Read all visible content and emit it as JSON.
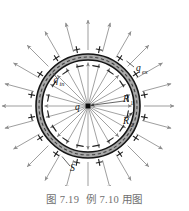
{
  "figure": {
    "caption_label": "图 7.19",
    "caption_text": "例 7.10 用图",
    "center_charge_label": "q",
    "inner_surface_charge_label": "q",
    "inner_surface_charge_sub": "in",
    "outer_surface_charge_label": "q",
    "outer_surface_charge_sub": "ex",
    "inner_radius_label": "R",
    "inner_radius_sub": "1",
    "outer_radius_label": "R",
    "outer_radius_sub": "2",
    "gaussian_surface_label": "S",
    "plus_sign": "+",
    "minus_sign": "−"
  },
  "chart_data": {
    "type": "diagram",
    "title": "图 7.19  例 7.10 用图",
    "center": {
      "x": 88,
      "y": 106
    },
    "geometry": {
      "cavity_radius_px": 46,
      "shell_inner_radius_px": 46,
      "shell_outer_radius_px": 52,
      "gaussian_dashed_radius_px": 49,
      "outer_field_line_end_radius_px": 86
    },
    "elements": [
      {
        "name": "point-charge",
        "label": "q",
        "position": "center",
        "kind": "filled-square-dot"
      },
      {
        "name": "shell-annulus",
        "fill": "#a8a8a8",
        "stroke": "#1a1a1a",
        "kind": "conducting-shell"
      },
      {
        "name": "gaussian-surface",
        "label": "S",
        "kind": "dashed-circle",
        "stroke": "#4d4d4d"
      },
      {
        "name": "inner-induced-charge",
        "label": "q",
        "sub": "in",
        "sign": "−"
      },
      {
        "name": "outer-induced-charge",
        "label": "q",
        "sub": "ex",
        "sign": "+"
      },
      {
        "name": "inner-radius-arrow",
        "label": "R",
        "sub": "1"
      },
      {
        "name": "outer-radius-arrow",
        "label": "R",
        "sub": "2"
      }
    ],
    "field_lines": {
      "inner_count": 24,
      "outer_count": 24,
      "direction": "radially outward",
      "inner_color": "#8a8a8a",
      "outer_color": "#9a9a9a"
    },
    "signs": {
      "inner_surface": {
        "symbol": "−",
        "count": 16,
        "color": "#2b2b2b"
      },
      "outer_surface": {
        "symbol": "+",
        "count": 16,
        "color": "#2b2b2b"
      }
    },
    "colors": {
      "shell_fill": "#a8a8a8",
      "outline": "#141414",
      "field_line": "#8f8f8f",
      "caption_text": "#6f6f6f",
      "label_text": "#1a1a1a"
    }
  }
}
